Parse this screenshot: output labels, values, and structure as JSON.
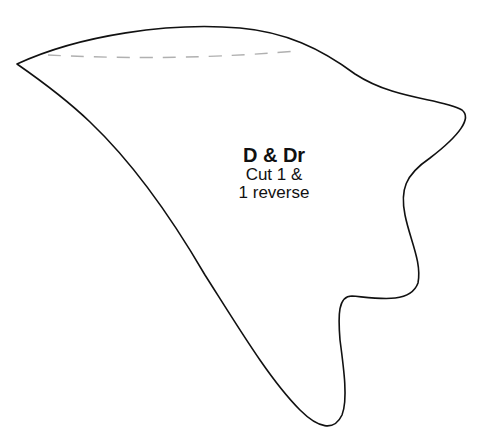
{
  "template": {
    "piece_label": "D & Dr",
    "instructions": [
      "Cut 1 &",
      "1 reverse"
    ],
    "outline_color": "#111111",
    "seam_line_color": "#b0b0b0",
    "seam_line_style": "dashed",
    "background_color": "#ffffff"
  }
}
